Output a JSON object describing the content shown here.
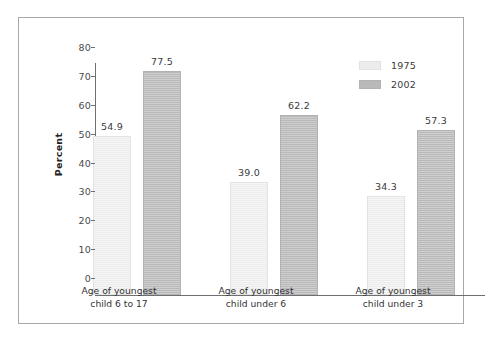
{
  "chart_data": {
    "type": "bar",
    "title": "",
    "subtitle": "",
    "xlabel": "",
    "ylabel": "Percent",
    "ylim": [
      0,
      80
    ],
    "yticks": [
      0,
      10,
      20,
      30,
      40,
      50,
      60,
      70,
      80
    ],
    "ytick_labels": [
      "0",
      "10",
      "20",
      "30",
      "40",
      "50",
      "60",
      "70",
      "80"
    ],
    "grid": false,
    "legend_position": "top-right",
    "categories": [
      "Age of youngest child 6 to 17",
      "Age of youngest child under 6",
      "Age of youngest child under 3"
    ],
    "category_lines": [
      [
        "Age of youngest",
        "child 6 to 17"
      ],
      [
        "Age of youngest",
        "child under 6"
      ],
      [
        "Age of youngest",
        "child under 3"
      ]
    ],
    "series": [
      {
        "name": "1975",
        "color": "#ececec",
        "values": [
          54.9,
          39.0,
          34.3
        ],
        "value_labels": [
          "54.9",
          "39.0",
          "34.3"
        ]
      },
      {
        "name": "2002",
        "color": "#b9b9b9",
        "values": [
          77.5,
          62.2,
          57.3
        ],
        "value_labels": [
          "77.5",
          "62.2",
          "57.3"
        ]
      }
    ]
  },
  "legend": {
    "items": [
      {
        "label": "1975",
        "color": "#ececec"
      },
      {
        "label": "2002",
        "color": "#b9b9b9"
      }
    ]
  },
  "axis": {
    "y_title": "Percent"
  },
  "colors": {
    "series_1975": "#ececec",
    "series_2002": "#b9b9b9",
    "axis_line": "#6f6f6f",
    "frame_border": "#a8a8a8",
    "text": "#333333",
    "background": "#ffffff"
  }
}
